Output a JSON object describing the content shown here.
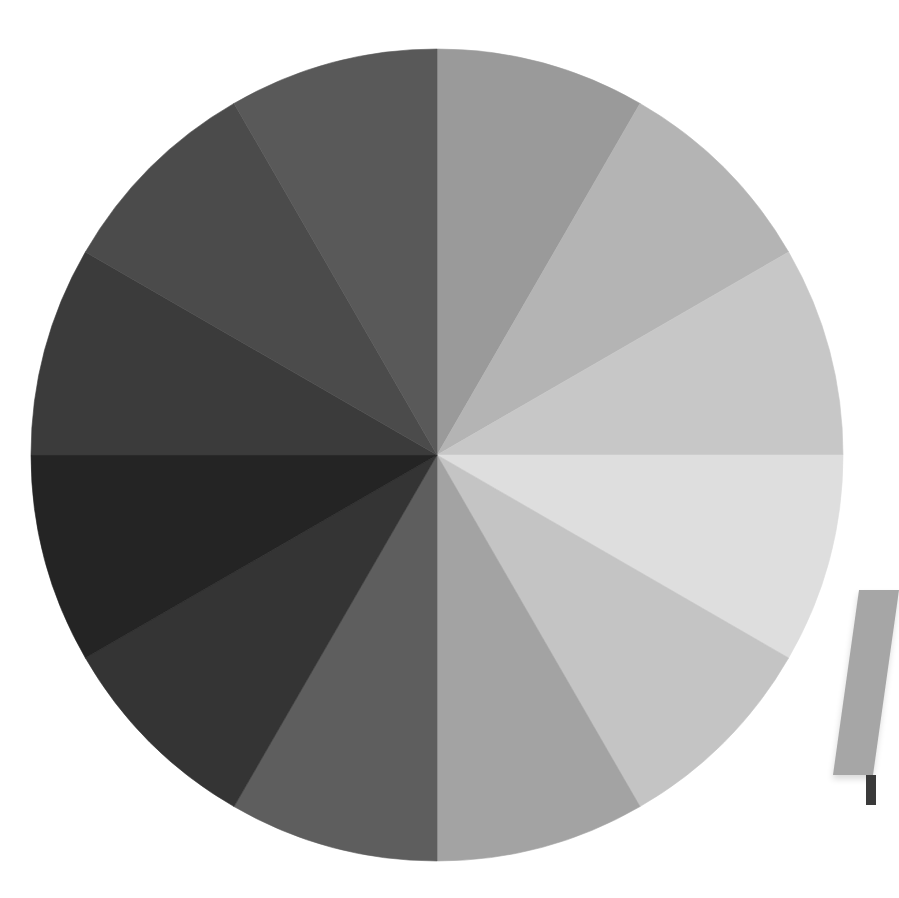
{
  "scene": {
    "description": "Grayscale value wheel divided into 12 equal wedges",
    "background": "#ffffff",
    "wheel": {
      "center": [
        437,
        455
      ],
      "radius": 406,
      "segment_count": 12,
      "start_angle_deg": 0,
      "direction": "clockwise from 12 o'clock",
      "segments": [
        {
          "index": 1,
          "from_deg": 0,
          "to_deg": 30,
          "color": "#9a9a9a"
        },
        {
          "index": 2,
          "from_deg": 30,
          "to_deg": 60,
          "color": "#b4b4b4"
        },
        {
          "index": 3,
          "from_deg": 60,
          "to_deg": 90,
          "color": "#c7c7c7"
        },
        {
          "index": 4,
          "from_deg": 90,
          "to_deg": 120,
          "color": "#dedede"
        },
        {
          "index": 5,
          "from_deg": 120,
          "to_deg": 150,
          "color": "#c4c4c4"
        },
        {
          "index": 6,
          "from_deg": 150,
          "to_deg": 180,
          "color": "#a3a3a3"
        },
        {
          "index": 7,
          "from_deg": 180,
          "to_deg": 210,
          "color": "#5e5e5e"
        },
        {
          "index": 8,
          "from_deg": 210,
          "to_deg": 240,
          "color": "#343434"
        },
        {
          "index": 9,
          "from_deg": 240,
          "to_deg": 270,
          "color": "#242424"
        },
        {
          "index": 10,
          "from_deg": 270,
          "to_deg": 300,
          "color": "#3b3b3b"
        },
        {
          "index": 11,
          "from_deg": 300,
          "to_deg": 330,
          "color": "#4b4b4b"
        },
        {
          "index": 12,
          "from_deg": 330,
          "to_deg": 360,
          "color": "#595959"
        }
      ]
    },
    "edge_object": {
      "description": "Partially visible gray card at right edge",
      "color": "#a6a6a6",
      "accent_color": "#3a3a3a"
    }
  }
}
